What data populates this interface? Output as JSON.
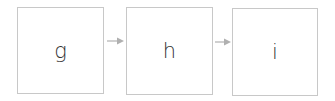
{
  "diagram": {
    "type": "flow",
    "direction": "left-to-right",
    "nodes": [
      {
        "id": "g",
        "label": "g"
      },
      {
        "id": "h",
        "label": "h"
      },
      {
        "id": "i",
        "label": "i"
      }
    ],
    "edges": [
      {
        "from": "g",
        "to": "h"
      },
      {
        "from": "h",
        "to": "i"
      }
    ],
    "colors": {
      "node_border": "#c8c8c8",
      "arrow": "#b0b0b0",
      "text": "#333333"
    }
  }
}
